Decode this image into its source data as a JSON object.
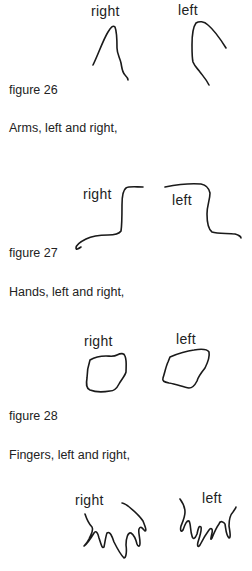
{
  "figures": [
    {
      "caption": "figure 26",
      "labels": {
        "right": "right",
        "left": "left"
      },
      "drawing": "arm-strokes"
    },
    {
      "heading": "Arms, left and right,",
      "caption": "figure 27",
      "labels": {
        "right": "right",
        "left": "left"
      },
      "drawing": "arm-outlines"
    },
    {
      "heading": "Hands, left and right,",
      "caption": "figure 28",
      "labels": {
        "right": "right",
        "left": "left"
      },
      "drawing": "hand-outlines"
    },
    {
      "heading": "Fingers, left and right,",
      "labels": {
        "right": "right",
        "left": "left"
      },
      "drawing": "finger-outlines"
    }
  ]
}
